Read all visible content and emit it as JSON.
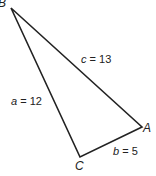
{
  "diagram": {
    "type": "triangle",
    "vertices": [
      {
        "name": "B",
        "x": 11,
        "y": 8
      },
      {
        "name": "A",
        "x": 142,
        "y": 127
      },
      {
        "name": "C",
        "x": 80,
        "y": 157
      }
    ],
    "sides": [
      {
        "var": "a",
        "eq": " = ",
        "value": "12"
      },
      {
        "var": "b",
        "eq": " = ",
        "value": "5"
      },
      {
        "var": "c",
        "eq": " = ",
        "value": "13"
      }
    ],
    "stroke": "#222222"
  }
}
